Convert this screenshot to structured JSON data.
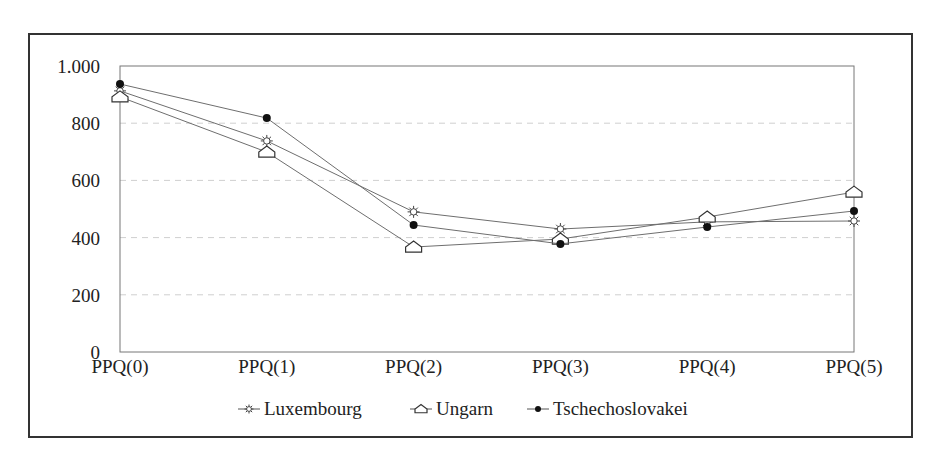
{
  "chart_data": {
    "type": "line",
    "title": "",
    "xlabel": "",
    "ylabel": "",
    "categories": [
      "PPQ(0)",
      "PPQ(1)",
      "PPQ(2)",
      "PPQ(3)",
      "PPQ(4)",
      "PPQ(5)"
    ],
    "ylim": [
      0,
      1000
    ],
    "yticks": [
      0,
      200,
      400,
      600,
      800,
      1000
    ],
    "ytick_labels": [
      "0",
      "200",
      "400",
      "600",
      "800",
      "1.000"
    ],
    "grid": {
      "horizontal": true,
      "style": "dashed"
    },
    "legend_position": "bottom",
    "series": [
      {
        "name": "Luxembourg",
        "marker": "sun",
        "values": [
          913,
          738,
          490,
          430,
          455,
          458
        ]
      },
      {
        "name": "Ungarn",
        "marker": "house",
        "values": [
          892,
          699,
          367,
          395,
          472,
          559
        ]
      },
      {
        "name": "Tschechoslovakei",
        "marker": "dot",
        "values": [
          937,
          818,
          444,
          378,
          437,
          493
        ]
      }
    ]
  },
  "legend": {
    "items": [
      "Luxembourg",
      "Ungarn",
      "Tschechoslovakei"
    ]
  },
  "colors": {
    "line": "#6e6e6e",
    "axis": "#777777",
    "grid": "#cfcfcf",
    "frame": "#333333",
    "marker_fill_dot": "#111111"
  }
}
